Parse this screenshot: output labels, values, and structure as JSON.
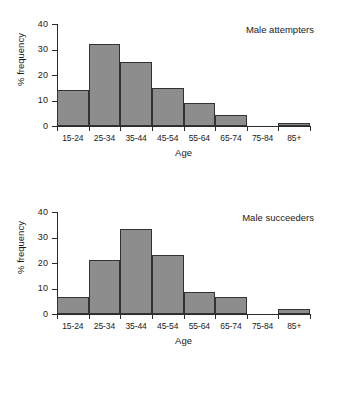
{
  "figure": {
    "background_color": "#ffffff",
    "bar_fill_color": "#8d8d8d",
    "bar_edge_color": "#333333",
    "axis_color": "#2b2b2b"
  },
  "charts": [
    {
      "id": "male-attempters",
      "title": "Male attempters",
      "xlabel": "Age",
      "ylabel": "% frequency",
      "yticks": [
        "40",
        "30",
        "20",
        "10",
        "0"
      ],
      "categories": [
        "15-24",
        "25-34",
        "35-44",
        "45-54",
        "55-64",
        "65-74",
        "75-84",
        "85+"
      ],
      "values": [
        14,
        32,
        25,
        15,
        9,
        4.5,
        0,
        1
      ]
    },
    {
      "id": "male-succeeders",
      "title": "Male succeeders",
      "xlabel": "Age",
      "ylabel": "% frequency",
      "yticks": [
        "40",
        "30",
        "20",
        "10",
        "0"
      ],
      "categories": [
        "15-24",
        "25-34",
        "35-44",
        "45-54",
        "55-64",
        "65-74",
        "75-84",
        "85+"
      ],
      "values": [
        6.5,
        21,
        33.5,
        23,
        8.5,
        6.5,
        0,
        2
      ]
    }
  ],
  "chart_data": [
    {
      "type": "bar",
      "title": "Male attempters",
      "xlabel": "Age",
      "ylabel": "% frequency",
      "categories": [
        "15-24",
        "25-34",
        "35-44",
        "45-54",
        "55-64",
        "65-74",
        "75-84",
        "85+"
      ],
      "values": [
        14,
        32,
        25,
        15,
        9,
        4.5,
        0,
        1
      ],
      "ylim": [
        0,
        40
      ],
      "yticks": [
        0,
        10,
        20,
        30,
        40
      ],
      "grid": false,
      "legend": "none"
    },
    {
      "type": "bar",
      "title": "Male succeeders",
      "xlabel": "Age",
      "ylabel": "% frequency",
      "categories": [
        "15-24",
        "25-34",
        "35-44",
        "45-54",
        "55-64",
        "65-74",
        "75-84",
        "85+"
      ],
      "values": [
        6.5,
        21,
        33.5,
        23,
        8.5,
        6.5,
        0,
        2
      ],
      "ylim": [
        0,
        40
      ],
      "yticks": [
        0,
        10,
        20,
        30,
        40
      ],
      "grid": false,
      "legend": "none"
    }
  ]
}
